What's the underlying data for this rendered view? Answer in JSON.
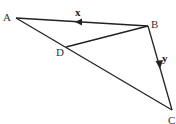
{
  "diagram": {
    "points": {
      "A": {
        "label": "A",
        "x": 16,
        "y": 18
      },
      "B": {
        "label": "B",
        "x": 148,
        "y": 26
      },
      "C": {
        "label": "C",
        "x": 172,
        "y": 110
      },
      "D": {
        "label": "D",
        "x": 66,
        "y": 47
      }
    },
    "vectors": {
      "x": {
        "label": "x",
        "from": "B",
        "to": "A"
      },
      "y": {
        "label": "y",
        "from": "B",
        "to": "C"
      }
    },
    "line_color": "#222222"
  }
}
